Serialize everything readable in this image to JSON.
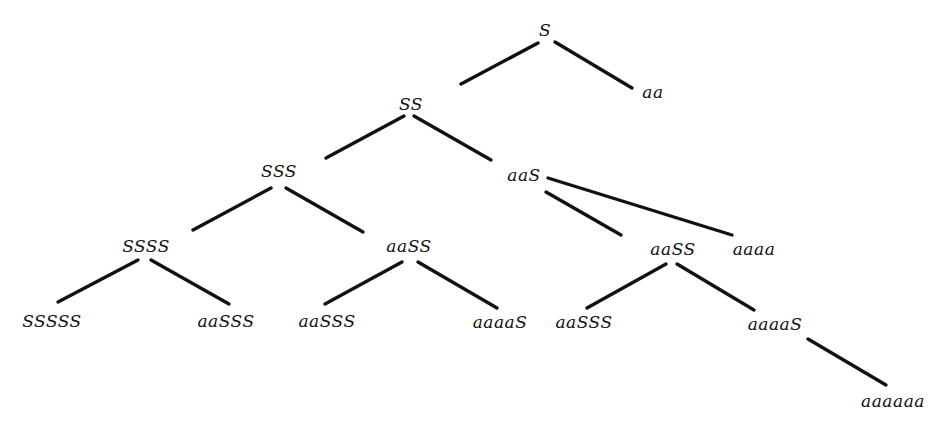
{
  "diagram": {
    "type": "derivation-tree",
    "nodes": [
      {
        "id": "n0",
        "label": "S",
        "x": 545,
        "y": 30
      },
      {
        "id": "n1",
        "label": "SS",
        "x": 411,
        "y": 104
      },
      {
        "id": "n2",
        "label": "aa",
        "x": 653,
        "y": 92
      },
      {
        "id": "n3",
        "label": "SSS",
        "x": 279,
        "y": 171
      },
      {
        "id": "n4",
        "label": "aaS",
        "x": 524,
        "y": 175
      },
      {
        "id": "n5",
        "label": "SSSS",
        "x": 146,
        "y": 246
      },
      {
        "id": "n6",
        "label": "aaSS",
        "x": 409,
        "y": 246
      },
      {
        "id": "n7",
        "label": "aaSS",
        "x": 673,
        "y": 249
      },
      {
        "id": "n8",
        "label": "aaaa",
        "x": 754,
        "y": 249
      },
      {
        "id": "n9",
        "label": "SSSSS",
        "x": 52,
        "y": 321
      },
      {
        "id": "n10",
        "label": "aaSSS",
        "x": 226,
        "y": 321
      },
      {
        "id": "n11",
        "label": "aaSSS",
        "x": 327,
        "y": 321
      },
      {
        "id": "n12",
        "label": "aaaaS",
        "x": 500,
        "y": 322
      },
      {
        "id": "n13",
        "label": "aaSSS",
        "x": 584,
        "y": 322
      },
      {
        "id": "n14",
        "label": "aaaaS",
        "x": 775,
        "y": 324
      },
      {
        "id": "n15",
        "label": "aaaaaa",
        "x": 893,
        "y": 401
      }
    ],
    "edges": [
      {
        "from": "n0",
        "to": "n1",
        "x1": 538,
        "y1": 43,
        "x2": 461,
        "y2": 84
      },
      {
        "from": "n0",
        "to": "n2",
        "x1": 555,
        "y1": 42,
        "x2": 632,
        "y2": 88
      },
      {
        "from": "n1",
        "to": "n3",
        "x1": 404,
        "y1": 116,
        "x2": 326,
        "y2": 158
      },
      {
        "from": "n1",
        "to": "n4",
        "x1": 414,
        "y1": 116,
        "x2": 491,
        "y2": 160
      },
      {
        "from": "n3",
        "to": "n5",
        "x1": 271,
        "y1": 188,
        "x2": 193,
        "y2": 230
      },
      {
        "from": "n3",
        "to": "n6",
        "x1": 286,
        "y1": 188,
        "x2": 363,
        "y2": 232
      },
      {
        "from": "n4",
        "to": "n8",
        "x1": 548,
        "y1": 178,
        "x2": 732,
        "y2": 235
      },
      {
        "from": "n4",
        "to": "n7",
        "x1": 546,
        "y1": 192,
        "x2": 621,
        "y2": 235
      },
      {
        "from": "n5",
        "to": "n9",
        "x1": 138,
        "y1": 260,
        "x2": 58,
        "y2": 302
      },
      {
        "from": "n5",
        "to": "n10",
        "x1": 151,
        "y1": 260,
        "x2": 229,
        "y2": 304
      },
      {
        "from": "n6",
        "to": "n11",
        "x1": 402,
        "y1": 262,
        "x2": 325,
        "y2": 304
      },
      {
        "from": "n6",
        "to": "n12",
        "x1": 418,
        "y1": 262,
        "x2": 497,
        "y2": 308
      },
      {
        "from": "n7",
        "to": "n13",
        "x1": 666,
        "y1": 264,
        "x2": 587,
        "y2": 308
      },
      {
        "from": "n7",
        "to": "n14",
        "x1": 677,
        "y1": 264,
        "x2": 754,
        "y2": 310
      },
      {
        "from": "n14",
        "to": "n15",
        "x1": 808,
        "y1": 339,
        "x2": 886,
        "y2": 385
      }
    ]
  }
}
